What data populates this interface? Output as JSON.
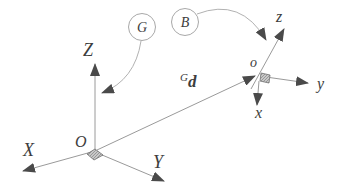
{
  "figure": {
    "colors": {
      "background": "#ffffff",
      "axis_line": "#9a9a9a",
      "arrowhead": "#4a4a4a",
      "label_text": "#3d3d3d",
      "circle_stroke": "#a8a8a8",
      "origin_marker_fill": "#c8c8c8",
      "origin_marker_stroke": "#6e6e6e"
    },
    "global_frame": {
      "badge_label": "G",
      "origin_label": "O",
      "axis_x_label": "X",
      "axis_y_label": "Y",
      "axis_z_label": "Z"
    },
    "body_frame": {
      "badge_label": "B",
      "origin_label": "o",
      "axis_x_label": "x",
      "axis_y_label": "y",
      "axis_z_label": "z"
    },
    "vector": {
      "superscript": "G",
      "symbol": "d"
    }
  }
}
